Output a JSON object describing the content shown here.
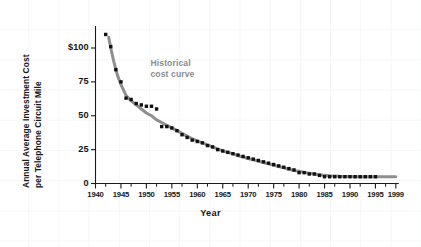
{
  "chart_data": {
    "type": "scatter",
    "title": "",
    "xlabel": "Year",
    "ylabel": "Annual Average Investment Cost per Telephone Circuit Mile",
    "ylabel_line1": "Annual Average Investment Cost",
    "ylabel_line2": "per Telephone Circuit Mile",
    "xlim": [
      1940,
      1999
    ],
    "ylim": [
      0,
      115
    ],
    "grid": true,
    "grid_color": "#f4f6f8",
    "legend": "none",
    "xticks": [
      1940,
      1945,
      1950,
      1955,
      1960,
      1965,
      1970,
      1975,
      1980,
      1985,
      1990,
      1995,
      1999
    ],
    "xtick_labels": [
      "1940",
      "1945",
      "1950",
      "1955",
      "1960",
      "1965",
      "1970",
      "1975",
      "1980",
      "1985",
      "1990",
      "1995",
      "1999"
    ],
    "xminorticks": [
      1942,
      1947,
      1952,
      1957,
      1962,
      1967,
      1972,
      1977,
      1982,
      1987,
      1992,
      1997
    ],
    "yticks": [
      0,
      25,
      50,
      75,
      100
    ],
    "ytick_labels": [
      "0",
      "25",
      "50",
      "75",
      "$100"
    ],
    "annotations": [
      {
        "name": "historical-cost-curve-label",
        "text_line1": "Historical",
        "text_line2": "cost curve",
        "color": "#8c8c8c",
        "x": 1951,
        "y": 88
      }
    ],
    "series": [
      {
        "name": "Annual average investment cost per telephone circuit mile",
        "type": "scatter",
        "marker": "square",
        "color": "#111111",
        "x": [
          1942,
          1943,
          1944,
          1945,
          1946,
          1947,
          1948,
          1949,
          1950,
          1951,
          1952,
          1953,
          1954,
          1955,
          1956,
          1957,
          1958,
          1959,
          1960,
          1961,
          1962,
          1963,
          1964,
          1965,
          1966,
          1967,
          1968,
          1969,
          1970,
          1971,
          1972,
          1973,
          1974,
          1975,
          1976,
          1977,
          1978,
          1979,
          1980,
          1981,
          1982,
          1983,
          1984,
          1985,
          1986,
          1987,
          1988,
          1989,
          1990,
          1991,
          1992,
          1993,
          1994,
          1995
        ],
        "y": [
          110,
          101,
          84,
          75,
          63,
          62,
          59,
          58,
          57,
          57,
          55,
          42,
          42,
          41,
          39,
          36,
          34,
          32,
          31,
          30,
          28,
          27,
          25,
          24,
          23,
          22,
          21,
          20,
          19,
          18,
          17,
          16,
          15,
          14,
          13,
          12,
          11,
          10,
          8,
          8,
          7,
          7,
          6,
          5,
          5,
          5,
          5,
          5,
          5,
          5,
          5,
          5,
          5,
          5
        ]
      },
      {
        "name": "Historical cost curve (fitted)",
        "type": "line",
        "color": "#8f8f8f",
        "linewidth": 3,
        "x": [
          1942.6,
          1943,
          1943.6,
          1944.3,
          1945,
          1946,
          1947,
          1948,
          1949,
          1950,
          1951,
          1952,
          1953,
          1954,
          1955,
          1956,
          1957,
          1958,
          1959,
          1960,
          1961,
          1962,
          1963,
          1964,
          1965,
          1966,
          1967,
          1968,
          1969,
          1970,
          1971,
          1972,
          1973,
          1974,
          1975,
          1976,
          1977,
          1978,
          1979,
          1980,
          1981,
          1982,
          1983,
          1984,
          1985,
          1986,
          1987,
          1988,
          1989,
          1990,
          1991,
          1992,
          1993,
          1994,
          1995,
          1996,
          1997,
          1998,
          1999
        ],
        "y": [
          108,
          100,
          90,
          80,
          73,
          65,
          61,
          58,
          55,
          52,
          50,
          47,
          45,
          43,
          41,
          39,
          37,
          35,
          33,
          31.5,
          30,
          28.5,
          27,
          25.5,
          24,
          23,
          22,
          20.5,
          19.5,
          18.5,
          17.5,
          16.5,
          15.5,
          14.5,
          13.5,
          12.5,
          11.5,
          10.5,
          9.5,
          9,
          8.2,
          7.6,
          7,
          6.5,
          6,
          5.7,
          5.5,
          5.3,
          5.2,
          5.1,
          5,
          5,
          5,
          5,
          5,
          5,
          5,
          5,
          5
        ]
      }
    ]
  }
}
